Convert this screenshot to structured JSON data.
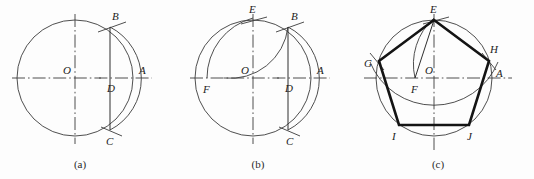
{
  "figure": {
    "background_color": "#fdfdfd",
    "line_color": "#3b3b3b",
    "heavy_color": "#141414",
    "width": 534,
    "height": 179
  },
  "panels": [
    {
      "id": "a",
      "caption": "(a)",
      "description": "Circle with horizontal and vertical centre lines; D is midpoint of OA; arc centred at D cuts the circle at B and C.",
      "center": {
        "x": 75,
        "y": 78
      },
      "radius": 58,
      "points": [
        {
          "name": "O",
          "label": "O",
          "x": 75,
          "y": 78,
          "label_x": 63,
          "label_y": 74
        },
        {
          "name": "A",
          "label": "A",
          "x": 133,
          "y": 78,
          "label_x": 139,
          "label_y": 74
        },
        {
          "name": "B",
          "label": "B",
          "x": 110,
          "y": 27,
          "label_x": 112,
          "label_y": 20
        },
        {
          "name": "C",
          "label": "C",
          "x": 110,
          "y": 130,
          "label_x": 108,
          "label_y": 143
        },
        {
          "name": "D",
          "label": "D",
          "x": 104,
          "y": 78,
          "label_x": 107,
          "label_y": 91
        }
      ],
      "arcs": [
        {
          "name": "main-circle",
          "cx": 75,
          "cy": 78,
          "r": 58
        },
        {
          "name": "arc-centred-at-D",
          "cx": 104,
          "cy": 78,
          "r": 58
        }
      ],
      "chords": [
        {
          "name": "chord-BC",
          "from": "B",
          "to": "C"
        }
      ]
    },
    {
      "id": "b",
      "caption": "(b)",
      "description": "Arc centred at D with radius DB swung down to F on the horizontal axis; arc centred at F with radius FB locates E at the top of the circle.",
      "center": {
        "x": 75,
        "y": 78
      },
      "radius": 58,
      "points": [
        {
          "name": "O",
          "label": "O",
          "x": 75,
          "y": 78,
          "label_x": 63,
          "label_y": 74
        },
        {
          "name": "A",
          "label": "A",
          "x": 133,
          "y": 78,
          "label_x": 139,
          "label_y": 74
        },
        {
          "name": "B",
          "label": "B",
          "x": 110,
          "y": 27,
          "label_x": 113,
          "label_y": 20
        },
        {
          "name": "C",
          "label": "C",
          "x": 110,
          "y": 130,
          "label_x": 110,
          "label_y": 143
        },
        {
          "name": "D",
          "label": "D",
          "x": 104,
          "y": 78,
          "label_x": 107,
          "label_y": 91
        },
        {
          "name": "E",
          "label": "E",
          "x": 75,
          "y": 20,
          "label_x": 72,
          "label_y": 13
        },
        {
          "name": "F",
          "label": "F",
          "x": 29,
          "y": 78,
          "label_x": 25,
          "label_y": 92
        }
      ],
      "arcs": [
        {
          "name": "main-circle",
          "cx": 75,
          "cy": 78,
          "r": 58
        },
        {
          "name": "arc-centred-at-D",
          "cx": 104,
          "cy": 78,
          "r": 58
        },
        {
          "name": "arc-centred-at-F",
          "cx": 29,
          "cy": 78,
          "r": 62
        }
      ],
      "chords": [
        {
          "name": "chord-BC",
          "from": "B",
          "to": "C"
        }
      ]
    },
    {
      "id": "c",
      "caption": "(c)",
      "description": "Chord EF is the side of the pentagon; stepping it round the circle gives the five vertices E, H, J, I, G which are joined with heavy lines.",
      "center": {
        "x": 78,
        "y": 78
      },
      "radius": 58,
      "points": [
        {
          "name": "O",
          "label": "O",
          "x": 78,
          "y": 78,
          "label_x": 70,
          "label_y": 74
        },
        {
          "name": "A",
          "label": "A",
          "x": 136,
          "y": 78,
          "label_x": 140,
          "label_y": 76
        },
        {
          "name": "E",
          "label": "E",
          "x": 78,
          "y": 20,
          "label_x": 74,
          "label_y": 13
        },
        {
          "name": "F",
          "label": "F",
          "x": 59,
          "y": 78,
          "label_x": 56,
          "label_y": 92
        },
        {
          "name": "G",
          "label": "G",
          "x": 23,
          "y": 61,
          "label_x": 10,
          "label_y": 66
        },
        {
          "name": "H",
          "label": "H",
          "x": 133,
          "y": 61,
          "label_x": 134,
          "label_y": 52
        },
        {
          "name": "I",
          "label": "I",
          "x": 43,
          "y": 125,
          "label_x": 37,
          "label_y": 138
        },
        {
          "name": "J",
          "label": "J",
          "x": 113,
          "y": 125,
          "label_x": 112,
          "label_y": 138
        }
      ],
      "arcs": [
        {
          "name": "main-circle",
          "cx": 78,
          "cy": 78,
          "r": 58
        },
        {
          "name": "arc-centred-at-F",
          "cx": 59,
          "cy": 78,
          "r": 62
        },
        {
          "name": "arc-centred-at-E",
          "cx": 78,
          "cy": 20,
          "r": 69
        }
      ],
      "construction_lines": [
        {
          "name": "line-EF",
          "from": "E",
          "to": "F"
        },
        {
          "name": "line-EG",
          "from": "E",
          "to": "G"
        }
      ],
      "pentagon": {
        "name": "pentagon-EHJIG",
        "vertices": [
          "E",
          "H",
          "J",
          "I",
          "G"
        ]
      }
    }
  ]
}
